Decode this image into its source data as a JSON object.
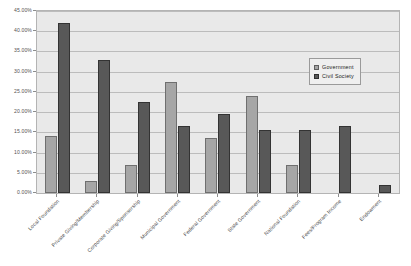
{
  "chart_data": {
    "type": "bar",
    "title": "",
    "xlabel": "",
    "ylabel": "",
    "ylim": [
      0,
      45
    ],
    "ytick_labels": [
      "45.00%",
      "40.00%",
      "35.00%",
      "30.00%",
      "25.00%",
      "20.00%",
      "15.00%",
      "10.00%",
      "5.00%",
      "0.00%"
    ],
    "ytick_values": [
      45,
      40,
      35,
      30,
      25,
      20,
      15,
      10,
      5,
      0
    ],
    "grid": true,
    "legend_position": "upper-right",
    "categories": [
      "Local Foundation",
      "Private Giving/Membership",
      "Corporate Giving/Sponsorship",
      "Municipal Government",
      "Federal Government",
      "State Government",
      "National Foundation",
      "Fees/Program Income",
      "Endowment"
    ],
    "series": [
      {
        "name": "Government",
        "color": "#a6a6a6",
        "values": [
          14.0,
          3.0,
          7.0,
          27.5,
          13.5,
          24.0,
          7.0,
          0,
          0
        ]
      },
      {
        "name": "Civil Society",
        "color": "#585858",
        "values": [
          42.0,
          33.0,
          22.5,
          16.5,
          19.5,
          15.5,
          15.5,
          16.5,
          2.0
        ]
      }
    ]
  },
  "legend": {
    "items": [
      {
        "label": "Government",
        "swatch": "government"
      },
      {
        "label": "Civil Society",
        "swatch": "civil"
      }
    ]
  }
}
